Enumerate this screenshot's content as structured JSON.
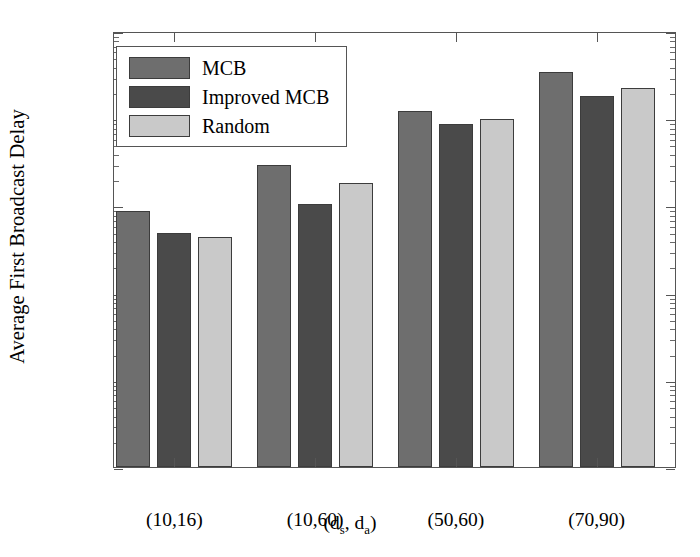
{
  "chart_data": {
    "type": "bar",
    "title": "",
    "subtitle": "",
    "xlabel": "(d_s, d_a)",
    "xlabel_parts": {
      "prefix": "(d",
      "sub1": "s",
      "mid": ", d",
      "sub2": "a",
      "suffix": ")"
    },
    "ylabel": "Average First Broadcast Delay",
    "yscale": "log",
    "ylim": [
      1,
      100000
    ],
    "ytick_values": [
      1,
      10,
      100,
      1000,
      10000,
      100000
    ],
    "ytick_labels": [
      "10⁰",
      "10¹",
      "10²",
      "10³",
      "10⁴",
      "10⁵"
    ],
    "ytick_exponents": [
      "0",
      "1",
      "2",
      "3",
      "4",
      "5"
    ],
    "ytick_mantissa": "10",
    "grid": false,
    "legend_position": "upper left",
    "categories": [
      "(10,16)",
      "(10,60)",
      "(50,60)",
      "(70,90)"
    ],
    "series": [
      {
        "name": "MCB",
        "color": "#6e6e6e",
        "values": [
          870,
          2900,
          12000,
          34000
        ]
      },
      {
        "name": "Improved MCB",
        "color": "#4a4a4a",
        "values": [
          480,
          1050,
          8500,
          18000
        ]
      },
      {
        "name": "Random",
        "color": "#c9c9c9",
        "values": [
          430,
          1800,
          9900,
          22000
        ]
      }
    ]
  },
  "legend": {
    "items": [
      {
        "label": "MCB",
        "color": "#6e6e6e"
      },
      {
        "label": "Improved MCB",
        "color": "#4a4a4a"
      },
      {
        "label": "Random",
        "color": "#c9c9c9"
      }
    ]
  },
  "axes": {
    "frame_color": "#555555",
    "background": "#ffffff"
  }
}
